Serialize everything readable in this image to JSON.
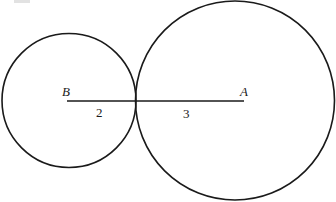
{
  "diagram": {
    "type": "tangent-circles",
    "colors": {
      "stroke": "#1a1a1a",
      "background": "#ffffff"
    },
    "circles": [
      {
        "name": "circle-B",
        "center_label": "B",
        "radius_units": 2
      },
      {
        "name": "circle-A",
        "center_label": "A",
        "radius_units": 3
      }
    ],
    "points": {
      "B": "B",
      "A": "A"
    },
    "segments": [
      {
        "from": "B",
        "to": "tangent-point",
        "length_label": "2"
      },
      {
        "from": "tangent-point",
        "to": "A",
        "length_label": "3"
      }
    ]
  }
}
